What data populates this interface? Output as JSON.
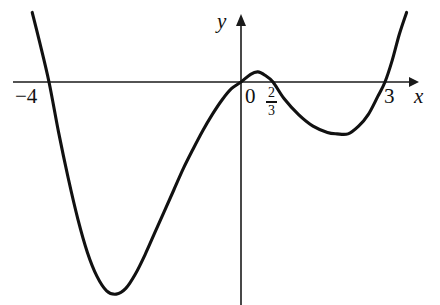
{
  "figure": {
    "background_color": "#ffffff",
    "curve_color": "#111111",
    "axis_color": "#1a1a1a"
  },
  "axes": {
    "x_axis_label": "x",
    "y_axis_label": "y",
    "origin_label": "0"
  },
  "labels": {
    "root_negative_four": "−4",
    "root_two_thirds_numerator": "2",
    "root_two_thirds_denominator": "3",
    "root_three": "3"
  },
  "chart_data": {
    "type": "line",
    "title": "",
    "xlabel": "x",
    "ylabel": "y",
    "grid": false,
    "legend": null,
    "x_intercepts": [
      -4,
      0,
      0.6667,
      3
    ],
    "x_intercept_labels": [
      "−4",
      "0",
      "2/3",
      "3"
    ],
    "xlim": [
      -4.75,
      3.65
    ],
    "ylim": [
      -4.6,
      1.45
    ],
    "critical_points": [
      {
        "kind": "local-minimum",
        "x": -2.73,
        "y": -4.42
      },
      {
        "kind": "local-maximum",
        "x": 0.35,
        "y": 0.21
      },
      {
        "kind": "local-minimum",
        "x": 2.23,
        "y": -1.08
      }
    ],
    "series": [
      {
        "name": "quartic curve",
        "x": [
          -4.35,
          -4.2,
          -4.0,
          -3.8,
          -3.6,
          -3.4,
          -3.2,
          -3.0,
          -2.8,
          -2.6,
          -2.4,
          -2.2,
          -2.0,
          -1.8,
          -1.6,
          -1.4,
          -1.2,
          -1.0,
          -0.8,
          -0.6,
          -0.4,
          -0.2,
          0.0,
          0.2,
          0.35,
          0.5,
          0.6667,
          0.9,
          1.2,
          1.5,
          1.8,
          2.0,
          2.23,
          2.45,
          2.65,
          2.85,
          3.0,
          3.15,
          3.3,
          3.45
        ],
        "y": [
          1.45,
          0.85,
          0.0,
          -1.05,
          -2.0,
          -2.85,
          -3.55,
          -4.05,
          -4.35,
          -4.42,
          -4.3,
          -4.0,
          -3.6,
          -3.15,
          -2.7,
          -2.25,
          -1.8,
          -1.4,
          -1.02,
          -0.68,
          -0.38,
          -0.14,
          0.0,
          0.16,
          0.21,
          0.14,
          0.0,
          -0.35,
          -0.68,
          -0.92,
          -1.05,
          -1.08,
          -1.08,
          -0.92,
          -0.68,
          -0.3,
          0.0,
          0.45,
          1.0,
          1.45
        ]
      }
    ]
  }
}
